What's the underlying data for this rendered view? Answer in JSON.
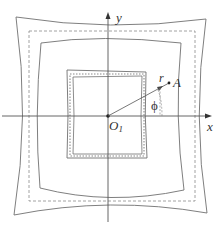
{
  "diagram": {
    "type": "geometric-figure",
    "labels": {
      "y_axis": "y",
      "x_axis": "x",
      "origin": "O",
      "origin_subscript": "1",
      "radius": "r",
      "point": "A",
      "angle": "ϕ"
    },
    "colors": {
      "line": "#707070",
      "dashed": "#8a8a8a",
      "axis": "#555555",
      "text": "#333333",
      "background": "#ffffff"
    },
    "contours": [
      {
        "name": "outer-solid-contour",
        "style": "solid"
      },
      {
        "name": "outer-dashed-square",
        "style": "dashed"
      },
      {
        "name": "middle-solid-contour",
        "style": "solid"
      },
      {
        "name": "inner-solid-contour",
        "style": "solid"
      },
      {
        "name": "inner-dotted-square",
        "style": "dotted"
      },
      {
        "name": "inner-core-contour",
        "style": "solid"
      }
    ]
  }
}
